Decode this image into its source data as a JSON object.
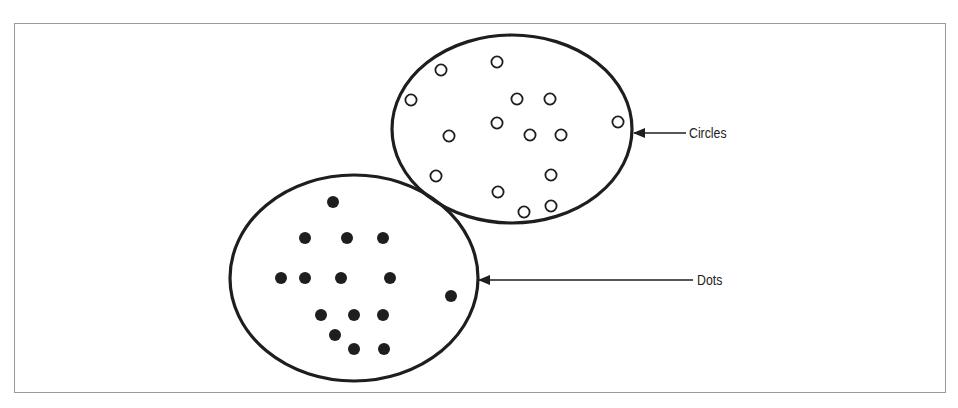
{
  "diagram": {
    "title": "",
    "labels": {
      "circles": "Circles",
      "dots": "Dots"
    },
    "colors": {
      "stroke": "#1e1e1e",
      "frame": "#9a9a9a",
      "background": "#ffffff"
    },
    "groups": [
      {
        "name": "circles",
        "label": "Circles",
        "marker": "hollow-circle",
        "ellipse": {
          "cx": 512,
          "cy": 129,
          "rx": 120,
          "ry": 94
        },
        "points": [
          [
            441,
            70
          ],
          [
            497,
            62
          ],
          [
            411,
            100
          ],
          [
            517,
            99
          ],
          [
            550,
            99
          ],
          [
            497,
            123
          ],
          [
            449,
            136
          ],
          [
            530,
            135
          ],
          [
            561,
            135
          ],
          [
            618,
            122
          ],
          [
            436,
            176
          ],
          [
            551,
            175
          ],
          [
            498,
            192
          ],
          [
            524,
            212
          ],
          [
            551,
            206
          ]
        ]
      },
      {
        "name": "dots",
        "label": "Dots",
        "marker": "filled-dot",
        "ellipse": {
          "cx": 354,
          "cy": 278,
          "rx": 124,
          "ry": 103
        },
        "points": [
          [
            333,
            202
          ],
          [
            305,
            238
          ],
          [
            347,
            238
          ],
          [
            383,
            238
          ],
          [
            281,
            278
          ],
          [
            305,
            278
          ],
          [
            341,
            278
          ],
          [
            390,
            278
          ],
          [
            451,
            296
          ],
          [
            321,
            315
          ],
          [
            354,
            315
          ],
          [
            383,
            315
          ],
          [
            335,
            335
          ],
          [
            354,
            349
          ],
          [
            384,
            349
          ]
        ]
      }
    ],
    "arrows": [
      {
        "target": "circles",
        "x1": 686,
        "y1": 133,
        "x2": 634,
        "y2": 133
      },
      {
        "target": "dots",
        "x1": 693,
        "y1": 280,
        "x2": 479,
        "y2": 280
      }
    ]
  }
}
